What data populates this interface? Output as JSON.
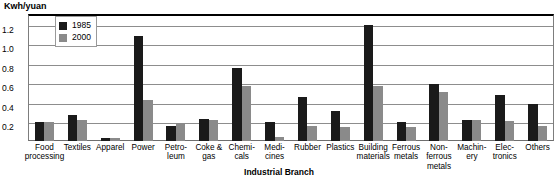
{
  "chart_data": {
    "type": "bar",
    "title": "",
    "unit_label": "Kwh/yuan",
    "xlabel": "Industrial Branch",
    "ylabel": "Kwh/yuan",
    "ylim": [
      0,
      1.3
    ],
    "yticks": [
      "1.2",
      "1.0",
      "0.8",
      "0.6",
      "0.4",
      "0.2"
    ],
    "ytick_values": [
      1.2,
      1.0,
      0.8,
      0.6,
      0.4,
      0.2
    ],
    "grid": true,
    "legend_position": "top-left-inside",
    "categories": [
      "Food processing",
      "Textiles",
      "Apparel",
      "Power",
      "Petroleum",
      "Coke & gas",
      "Chemicals",
      "Medicines",
      "Rubber",
      "Plastics",
      "Building materials",
      "Ferrous metals",
      "Non-ferrous metals",
      "Machinery",
      "Electronics",
      "Others"
    ],
    "category_lines": [
      [
        "Food",
        "processing"
      ],
      [
        "Textiles"
      ],
      [
        "Apparel"
      ],
      [
        "Power"
      ],
      [
        "Petro-",
        "leum"
      ],
      [
        "Coke &",
        "gas"
      ],
      [
        "Chemi-",
        "cals"
      ],
      [
        "Medi-",
        "cines"
      ],
      [
        "Rubber"
      ],
      [
        "Plastics"
      ],
      [
        "Building",
        "materials"
      ],
      [
        "Ferrous",
        "metals"
      ],
      [
        "Non-",
        "ferrous",
        "metals"
      ],
      [
        "Machin-",
        "ery"
      ],
      [
        "Elec-",
        "tronics"
      ],
      [
        "Others"
      ]
    ],
    "series": [
      {
        "name": "1985",
        "color": "#1a1a1a",
        "values": [
          0.19,
          0.27,
          0.03,
          1.07,
          0.15,
          0.23,
          0.75,
          0.19,
          0.45,
          0.31,
          1.19,
          0.19,
          0.58,
          0.22,
          0.47,
          0.38
        ]
      },
      {
        "name": "2000",
        "color": "#8a8a8a",
        "values": [
          0.19,
          0.22,
          0.03,
          0.42,
          0.18,
          0.22,
          0.56,
          0.04,
          0.15,
          0.14,
          0.56,
          0.14,
          0.5,
          0.22,
          0.2,
          0.15
        ]
      }
    ]
  },
  "legend": {
    "entries": [
      {
        "label": "1985"
      },
      {
        "label": "2000"
      }
    ]
  }
}
